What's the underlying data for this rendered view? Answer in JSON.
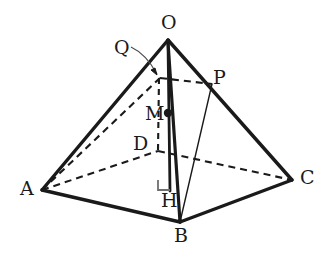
{
  "figure": {
    "kind": "geometry-diagram",
    "width": 334,
    "height": 271,
    "background_color": "#ffffff",
    "stroke_color": "#1a1a1a",
    "labels": [
      {
        "id": "O",
        "text": "O",
        "x": 161,
        "y": 13,
        "role": "apex-vertex"
      },
      {
        "id": "Q",
        "text": "Q",
        "x": 114,
        "y": 38,
        "role": "point-on-altitude"
      },
      {
        "id": "P",
        "text": "P",
        "x": 213,
        "y": 68,
        "role": "point-on-edge-OC"
      },
      {
        "id": "M",
        "text": "M",
        "x": 145,
        "y": 104,
        "role": "interior-point"
      },
      {
        "id": "D",
        "text": "D",
        "x": 133,
        "y": 134,
        "role": "hidden-base-vertex"
      },
      {
        "id": "A",
        "text": "A",
        "x": 20,
        "y": 179,
        "role": "base-vertex"
      },
      {
        "id": "C",
        "text": "C",
        "x": 300,
        "y": 168,
        "role": "base-vertex"
      },
      {
        "id": "H",
        "text": "H",
        "x": 161,
        "y": 191,
        "role": "foot-of-altitude"
      },
      {
        "id": "B",
        "text": "B",
        "x": 174,
        "y": 226,
        "role": "base-vertex"
      }
    ],
    "points": {
      "O": {
        "x": 168,
        "y": 40
      },
      "A": {
        "x": 42,
        "y": 190
      },
      "B": {
        "x": 180,
        "y": 222
      },
      "C": {
        "x": 292,
        "y": 180
      },
      "D": {
        "x": 158,
        "y": 151
      },
      "H": {
        "x": 170,
        "y": 190
      },
      "M": {
        "x": 168,
        "y": 113
      },
      "Q": {
        "x": 160,
        "y": 78
      },
      "P": {
        "x": 212,
        "y": 84
      }
    },
    "solid_edges": [
      {
        "name": "edge-OA",
        "from": "O",
        "to": "A",
        "width": 3.2
      },
      {
        "name": "edge-OC",
        "from": "O",
        "to": "C",
        "width": 3.2
      },
      {
        "name": "edge-OB",
        "from": "O",
        "to": "B",
        "width": 3.2
      },
      {
        "name": "edge-AB",
        "from": "A",
        "to": "B",
        "width": 3.2
      },
      {
        "name": "edge-BC",
        "from": "B",
        "to": "C",
        "width": 3.2
      },
      {
        "name": "altitude-OH",
        "from": "O",
        "to": "H",
        "width": 2.6
      },
      {
        "name": "segment-PB",
        "from": "P",
        "to": "B",
        "width": 1.3
      }
    ],
    "dashed_edges": [
      {
        "name": "edge-AD",
        "from": "A",
        "to": "D"
      },
      {
        "name": "edge-DC",
        "from": "D",
        "to": "C"
      },
      {
        "name": "diagonal-AQ",
        "from": "A",
        "to": "Q"
      },
      {
        "name": "segment-QP",
        "from": "Q",
        "to": "P"
      },
      {
        "name": "segment-QD",
        "from": "Q",
        "to": "D"
      }
    ],
    "dots": [
      {
        "name": "point-marker-M",
        "x": 168,
        "y": 113,
        "r": 4.2
      }
    ],
    "right_angle": {
      "name": "right-angle-mark-at-H",
      "vertex_x": 170,
      "vertex_y": 190,
      "size": 10
    },
    "leader": {
      "name": "leader-line-Q",
      "from_x": 131,
      "from_y": 47,
      "to_x": 158,
      "to_y": 76
    }
  }
}
